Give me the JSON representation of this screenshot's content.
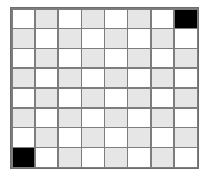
{
  "figure": {
    "kind": "checkerboard-grid",
    "canvas_width": 209,
    "canvas_height": 176,
    "background_color": "#ffffff"
  },
  "board": {
    "rows": 8,
    "columns": 8,
    "left": 10,
    "top": 7,
    "width": 189,
    "height": 162,
    "gridline_color": "#7d7d7d",
    "border_color": "#6e6e6e",
    "gridline_width": 1.5
  },
  "palette": {
    "light": "#ffffff",
    "shaded": "#e6e6e6",
    "dark": "#000000"
  },
  "legend": {
    "light_label": "white square",
    "shaded_label": "light gray square",
    "dark_label": "black square"
  },
  "marked_cells": [
    {
      "row": 1,
      "column": 8,
      "state": "dark",
      "position": "top-right"
    },
    {
      "row": 8,
      "column": 1,
      "state": "dark",
      "position": "bottom-left"
    }
  ],
  "counts": {
    "total_cells": 64,
    "light_cells": 32,
    "shaded_cells": 30,
    "dark_cells": 2
  },
  "grid": [
    [
      "light",
      "shaded",
      "light",
      "shaded",
      "light",
      "shaded",
      "light",
      "dark"
    ],
    [
      "shaded",
      "light",
      "shaded",
      "light",
      "shaded",
      "light",
      "shaded",
      "light"
    ],
    [
      "light",
      "shaded",
      "light",
      "shaded",
      "light",
      "shaded",
      "light",
      "shaded"
    ],
    [
      "shaded",
      "light",
      "shaded",
      "light",
      "shaded",
      "light",
      "shaded",
      "light"
    ],
    [
      "light",
      "shaded",
      "light",
      "shaded",
      "light",
      "shaded",
      "light",
      "shaded"
    ],
    [
      "shaded",
      "light",
      "shaded",
      "light",
      "shaded",
      "light",
      "shaded",
      "light"
    ],
    [
      "light",
      "shaded",
      "light",
      "shaded",
      "light",
      "shaded",
      "light",
      "shaded"
    ],
    [
      "dark",
      "light",
      "shaded",
      "light",
      "shaded",
      "light",
      "shaded",
      "light"
    ]
  ]
}
